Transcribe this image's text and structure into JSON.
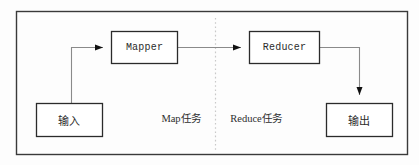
{
  "diagram": {
    "background_color": "#fdfdfd",
    "border_color": "#3a3a3a",
    "box_border_color": "#2b2b2b",
    "connector_color": "#7a7a7a",
    "arrowhead_color": "#111111",
    "divider_color": "#c9c9c9",
    "text_color": "#2b2b2b"
  },
  "nodes": {
    "input": {
      "label": "输入",
      "x": 36,
      "y": 103,
      "w": 67,
      "h": 34
    },
    "mapper": {
      "label": "Mapper",
      "x": 111,
      "y": 31,
      "w": 67,
      "h": 33
    },
    "reducer": {
      "label": "Reducer",
      "x": 249,
      "y": 31,
      "w": 71,
      "h": 33
    },
    "output": {
      "label": "输出",
      "x": 326,
      "y": 103,
      "w": 67,
      "h": 34
    }
  },
  "phases": {
    "map": {
      "label": "Map任务",
      "x": 155,
      "y": 110
    },
    "reduce": {
      "label": "Reduce任务",
      "x": 223,
      "y": 110
    }
  },
  "divider": {
    "name": "phase-divider",
    "x": 215,
    "y_top": 18,
    "y_bottom": 150,
    "style": "dotted"
  },
  "edges": [
    {
      "name": "input-to-mapper",
      "from": "input",
      "to": "mapper",
      "arrow": "right"
    },
    {
      "name": "mapper-to-reducer",
      "from": "mapper",
      "to": "reducer",
      "arrow": "right"
    },
    {
      "name": "reducer-to-output",
      "from": "reducer",
      "to": "output",
      "arrow": "down"
    }
  ],
  "frame": {
    "x": 16,
    "y": 11,
    "w": 392,
    "h": 144
  }
}
